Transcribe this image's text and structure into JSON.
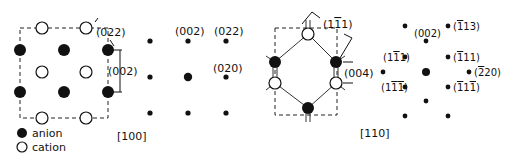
{
  "legend": {
    "anion": "anion",
    "cation": "cation"
  },
  "panel_real_100": {
    "labels": {
      "plane_022": "(022)",
      "plane_002": "(002)"
    }
  },
  "panel_diff_100": {
    "zone_axis": "[100]",
    "labels": {
      "s002": "(002)",
      "s022": "(022)",
      "s020": "(020)"
    }
  },
  "panel_real_110": {
    "labels": {
      "plane_1m11": "(1̅1)",
      "plane_004": "(004)"
    }
  },
  "panel_diff_110": {
    "zone_axis": "[110]",
    "labels": {
      "s002": "(002)",
      "s_m113": "(̅1̅13)",
      "s_1m11": "(1̅1̅1)",
      "s_m111": "(̅1̅ 11)",
      "s_m220": "(2̅ 20)",
      "s_1m1m1": "(1̅1̅1̅)",
      "s_m11m1": "(1̅1̅1̅)"
    }
  },
  "colors": {
    "ink": "#111111",
    "background": "#ffffff"
  }
}
